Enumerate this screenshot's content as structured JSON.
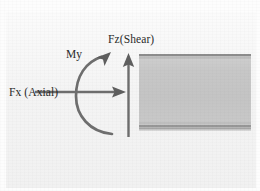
{
  "figure": {
    "width": 260,
    "height": 191,
    "background_color": "#fdfdfd",
    "paper_color": "#f3f3f3"
  },
  "labels": {
    "axial": "Fx (Axial)",
    "shear": "Fz(Shear)",
    "moment": "My"
  },
  "arrows": {
    "axial": {
      "name": "horizontal-arrow",
      "direction": "right",
      "from": [
        35,
        92
      ],
      "to": [
        126,
        92
      ],
      "color": "#6b6b6b"
    },
    "shear": {
      "name": "vertical-arrow",
      "direction": "up",
      "from": [
        128,
        137
      ],
      "to": [
        128,
        54
      ],
      "color": "#6b6b6b"
    },
    "moment": {
      "name": "curved-moment-arrow",
      "direction": "counterclockwise",
      "color": "#6b6b6b"
    }
  },
  "beam": {
    "name": "beam-body",
    "x": 139,
    "y": 54,
    "width": 112,
    "height": 76,
    "fill_color": "#c8c8c8",
    "edge_color": "#8f8f8f",
    "flange_lines": 4
  }
}
